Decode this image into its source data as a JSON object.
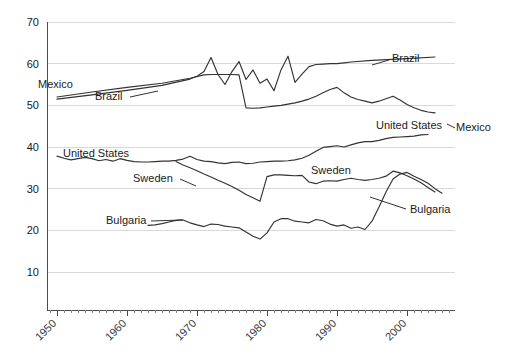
{
  "chart_data": {
    "type": "line",
    "title": "",
    "subtitle": "",
    "xlabel": "",
    "ylabel": "",
    "xlim": [
      1948,
      2008
    ],
    "ylim": [
      0,
      70
    ],
    "grid": true,
    "grid_axis": "y",
    "legend_position": "inline-labels",
    "yticks": [
      10,
      20,
      30,
      40,
      50,
      60,
      70
    ],
    "ytick_labels": [
      "10",
      "20",
      "30",
      "40",
      "50",
      "60",
      "70"
    ],
    "xticks": [
      1950,
      1960,
      1970,
      1980,
      1990,
      2000
    ],
    "xtick_labels": [
      "1950",
      "1960",
      "1970",
      "1980",
      "1990",
      "2000"
    ],
    "xtick_minor_step": 1,
    "line_color": "#333333",
    "grid_color": "#d9d9d9",
    "axis_color": "#4d4d4d",
    "series": [
      {
        "name": "Mexico",
        "label_left": "Mexico",
        "label_right": "Mexico",
        "x": [
          1950,
          1955,
          1960,
          1965,
          1969,
          1971,
          1972,
          1973,
          1974,
          1975,
          1976,
          1977,
          1978,
          1979,
          1980,
          1981,
          1982,
          1983,
          1984,
          1985,
          1986,
          1987,
          1988,
          1989,
          1990,
          1991,
          1992,
          1993,
          1994,
          1995,
          1996,
          1997,
          1998,
          1999,
          2000,
          2001,
          2002,
          2003,
          2004
        ],
        "y": [
          52.0,
          53.2,
          54.3,
          55.3,
          56.5,
          57.3,
          57.4,
          57.4,
          57.4,
          57.4,
          57.3,
          49.4,
          49.3,
          49.4,
          49.6,
          49.8,
          50.0,
          50.3,
          50.6,
          51.0,
          51.5,
          52.2,
          53.0,
          53.8,
          54.3,
          53.0,
          52.0,
          51.4,
          51.0,
          50.6,
          51.0,
          51.6,
          52.2,
          51.3,
          50.2,
          49.4,
          48.8,
          48.4,
          48.2
        ]
      },
      {
        "name": "Brazil",
        "label_left": "Brazil",
        "label_right": "Brazil",
        "x": [
          1950,
          1955,
          1960,
          1965,
          1969,
          1970,
          1971,
          1972,
          1973,
          1974,
          1975,
          1976,
          1977,
          1978,
          1979,
          1980,
          1981,
          1982,
          1983,
          1984,
          1985,
          1986,
          1987,
          1988,
          1989,
          1990,
          1991,
          1992,
          1995,
          2000,
          2004
        ],
        "y": [
          51.5,
          52.5,
          53.6,
          54.8,
          56.3,
          57.0,
          58.1,
          61.5,
          57.4,
          55.0,
          58.1,
          60.5,
          56.2,
          58.5,
          55.3,
          56.3,
          53.5,
          58.5,
          61.8,
          55.5,
          57.5,
          59.3,
          59.8,
          59.9,
          60.0,
          60.0,
          60.2,
          60.4,
          60.8,
          61.2,
          61.6
        ]
      },
      {
        "name": "United States",
        "label_left": "United States",
        "label_right": "United States",
        "x": [
          1950,
          1951,
          1952,
          1953,
          1954,
          1955,
          1956,
          1957,
          1958,
          1959,
          1960,
          1961,
          1962,
          1963,
          1964,
          1965,
          1966,
          1967,
          1968,
          1969,
          1970,
          1971,
          1972,
          1973,
          1974,
          1975,
          1976,
          1977,
          1978,
          1979,
          1980,
          1981,
          1982,
          1983,
          1984,
          1985,
          1986,
          1987,
          1988,
          1989,
          1990,
          1991,
          1992,
          1993,
          1994,
          1995,
          1996,
          1997,
          1998,
          1999,
          2000,
          2001,
          2002,
          2003
        ],
        "y": [
          37.8,
          37.3,
          36.9,
          37.2,
          37.5,
          37.2,
          36.7,
          37.0,
          36.6,
          37.2,
          36.8,
          36.5,
          36.4,
          36.4,
          36.5,
          36.6,
          36.6,
          36.8,
          37.1,
          37.8,
          37.0,
          36.6,
          36.5,
          36.2,
          36.0,
          36.3,
          36.4,
          36.0,
          36.1,
          36.4,
          36.5,
          36.6,
          36.6,
          36.7,
          36.9,
          37.3,
          38.0,
          39.0,
          39.9,
          40.1,
          40.3,
          40.0,
          40.5,
          41.0,
          41.3,
          41.3,
          41.6,
          42.0,
          42.3,
          42.4,
          42.5,
          42.6,
          42.9,
          43.0
        ]
      },
      {
        "name": "Sweden",
        "label_left": "Sweden",
        "label_right": "Sweden",
        "x": [
          1967,
          1968,
          1969,
          1970,
          1971,
          1972,
          1973,
          1974,
          1975,
          1976,
          1977,
          1978,
          1979,
          1980,
          1981,
          1982,
          1983,
          1984,
          1985,
          1986,
          1987,
          1988,
          1989,
          1990,
          1991,
          1992,
          1993,
          1994,
          1995,
          1996,
          1997,
          1998,
          1999,
          2000,
          2001,
          2002,
          2003,
          2004
        ],
        "y": [
          36.5,
          35.7,
          35.0,
          34.3,
          33.5,
          32.8,
          32.0,
          31.3,
          30.5,
          29.6,
          28.6,
          27.8,
          27.0,
          32.9,
          33.3,
          33.3,
          33.2,
          33.1,
          33.2,
          31.6,
          31.2,
          31.8,
          31.9,
          31.8,
          32.2,
          32.5,
          32.2,
          32.0,
          32.2,
          32.5,
          33.0,
          34.2,
          33.8,
          33.1,
          32.3,
          31.4,
          30.3,
          29.2
        ]
      },
      {
        "name": "Bulgaria",
        "label_left": "Bulgaria",
        "label_right": "Bulgaria",
        "x": [
          1963,
          1964,
          1965,
          1966,
          1967,
          1968,
          1969,
          1970,
          1971,
          1972,
          1973,
          1974,
          1975,
          1976,
          1977,
          1978,
          1979,
          1980,
          1981,
          1982,
          1983,
          1984,
          1985,
          1986,
          1987,
          1988,
          1989,
          1990,
          1991,
          1992,
          1993,
          1994,
          1995,
          1996,
          1997,
          1998,
          1999,
          2000,
          2001,
          2002,
          2003,
          2004,
          2005
        ],
        "y": [
          21.2,
          21.3,
          21.6,
          22.0,
          22.4,
          22.5,
          21.8,
          21.3,
          20.9,
          21.5,
          21.4,
          21.0,
          20.8,
          20.6,
          19.6,
          18.6,
          17.9,
          19.4,
          22.0,
          22.8,
          22.8,
          22.2,
          22.0,
          21.8,
          22.6,
          22.3,
          21.5,
          21.0,
          21.3,
          20.5,
          20.8,
          20.2,
          22.2,
          25.6,
          29.2,
          32.3,
          33.5,
          33.9,
          33.0,
          32.2,
          31.3,
          30.0,
          28.9
        ]
      }
    ],
    "inline_labels": [
      {
        "text": "Mexico",
        "x_px": 38,
        "y_px": 88,
        "anchor": "start",
        "leader": null
      },
      {
        "text": "Brazil",
        "x_px": 95,
        "y_px": 100,
        "anchor": "start",
        "leader": {
          "x1": 130,
          "y1": 97,
          "x2": 158,
          "y2": 91
        }
      },
      {
        "text": "Brazil",
        "x_px": 392,
        "y_px": 62,
        "anchor": "start",
        "leader": {
          "x1": 372,
          "y1": 65,
          "x2": 389,
          "y2": 60
        }
      },
      {
        "text": "Mexico",
        "x_px": 456,
        "y_px": 131,
        "anchor": "start",
        "leader": {
          "x1": 447,
          "y1": 124,
          "x2": 455,
          "y2": 128
        }
      },
      {
        "text": "United States",
        "x_px": 63,
        "y_px": 157,
        "anchor": "start",
        "leader": null
      },
      {
        "text": "United States",
        "x_px": 376,
        "y_px": 129,
        "anchor": "start",
        "leader": null
      },
      {
        "text": "Sweden",
        "x_px": 133,
        "y_px": 182,
        "anchor": "start",
        "leader": {
          "x1": 180,
          "y1": 179,
          "x2": 196,
          "y2": 186
        }
      },
      {
        "text": "Sweden",
        "x_px": 311,
        "y_px": 174,
        "anchor": "start",
        "leader": null
      },
      {
        "text": "Bulgaria",
        "x_px": 106,
        "y_px": 224,
        "anchor": "start",
        "leader": {
          "x1": 151,
          "y1": 221,
          "x2": 182,
          "y2": 220
        }
      },
      {
        "text": "Bulgaria",
        "x_px": 410,
        "y_px": 213,
        "anchor": "start",
        "leader": {
          "x1": 370,
          "y1": 197,
          "x2": 406,
          "y2": 209
        }
      }
    ]
  }
}
